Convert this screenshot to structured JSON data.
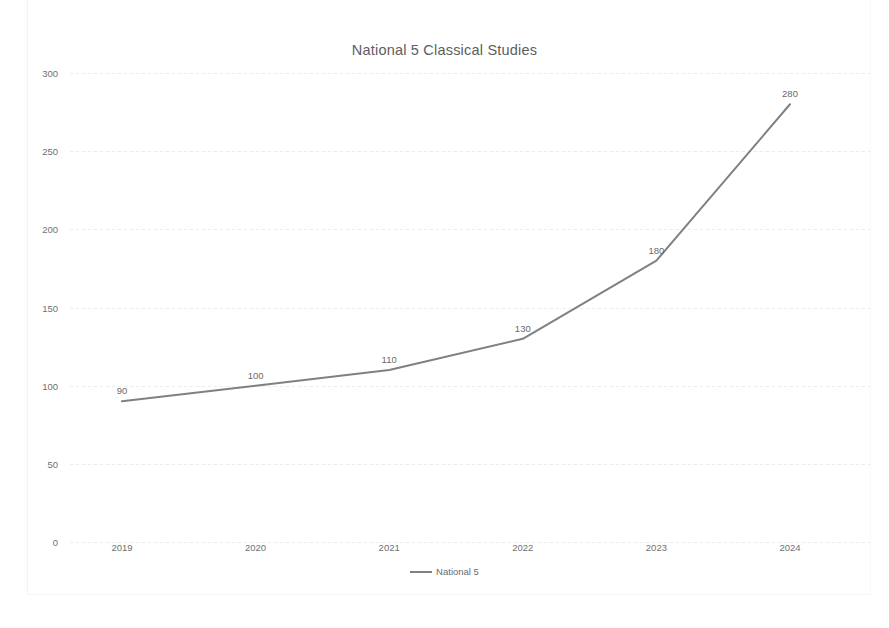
{
  "chart_data": {
    "type": "line",
    "title": "National 5 Classical Studies",
    "xlabel": "",
    "ylabel": "",
    "categories": [
      "2019",
      "2020",
      "2021",
      "2022",
      "2023",
      "2024"
    ],
    "series": [
      {
        "name": "National 5",
        "values": [
          90,
          100,
          110,
          130,
          180,
          280
        ],
        "color": "#808080"
      }
    ],
    "data_labels": [
      "90",
      "100",
      "110",
      "130",
      "180",
      "280"
    ],
    "ylim": [
      0,
      300
    ],
    "yticks": [
      0,
      50,
      100,
      150,
      200,
      250,
      300
    ],
    "ytick_labels": [
      "0",
      "50",
      "100",
      "150",
      "200",
      "250",
      "300"
    ],
    "grid": true,
    "legend_position": "bottom",
    "legend_entries": [
      "National 5"
    ]
  }
}
